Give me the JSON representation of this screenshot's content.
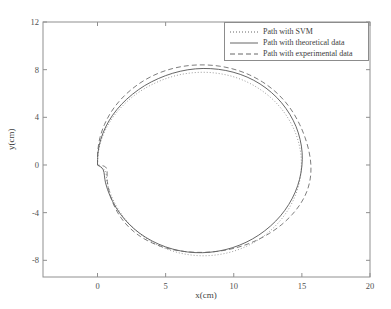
{
  "chart_data": {
    "type": "line",
    "title": "",
    "xlabel": "x(cm)",
    "ylabel": "y(cm)",
    "xlim": [
      -4,
      20
    ],
    "ylim": [
      -9.4,
      12
    ],
    "xticks": [
      0,
      5,
      10,
      15,
      20
    ],
    "xtick_labels": [
      "0",
      "5",
      "10",
      "15",
      "20"
    ],
    "yticks": [
      12,
      8,
      4,
      0,
      -4,
      -8
    ],
    "ytick_labels": [
      "12",
      "8",
      "4",
      "0",
      "-4",
      "-8"
    ],
    "grid": false,
    "legend_position": "upper right",
    "series": [
      {
        "name": "Path with SVM",
        "style": "dotted",
        "color": "#8a8a8a",
        "description": "Closed circular path, nearly coincident with theoretical path, slight deviations in lower-left quadrant",
        "points": [
          [
            0.0,
            0.0
          ],
          [
            0.06,
            1.05
          ],
          [
            0.28,
            2.1
          ],
          [
            0.66,
            3.12
          ],
          [
            1.18,
            4.08
          ],
          [
            1.85,
            4.97
          ],
          [
            2.64,
            5.78
          ],
          [
            3.54,
            6.47
          ],
          [
            4.53,
            7.03
          ],
          [
            5.58,
            7.45
          ],
          [
            6.68,
            7.7
          ],
          [
            7.79,
            7.78
          ],
          [
            8.89,
            7.68
          ],
          [
            9.96,
            7.41
          ],
          [
            10.97,
            6.97
          ],
          [
            11.9,
            6.37
          ],
          [
            12.74,
            5.63
          ],
          [
            13.46,
            4.77
          ],
          [
            14.05,
            3.81
          ],
          [
            14.5,
            2.78
          ],
          [
            14.8,
            1.7
          ],
          [
            14.95,
            0.59
          ],
          [
            14.94,
            -0.53
          ],
          [
            14.78,
            -1.63
          ],
          [
            14.47,
            -2.7
          ],
          [
            14.01,
            -3.72
          ],
          [
            13.41,
            -4.67
          ],
          [
            12.68,
            -5.52
          ],
          [
            11.84,
            -6.25
          ],
          [
            10.9,
            -6.84
          ],
          [
            9.89,
            -7.27
          ],
          [
            8.83,
            -7.53
          ],
          [
            7.74,
            -7.62
          ],
          [
            6.65,
            -7.52
          ],
          [
            5.59,
            -7.25
          ],
          [
            4.58,
            -6.81
          ],
          [
            3.65,
            -6.22
          ],
          [
            2.82,
            -5.49
          ],
          [
            2.1,
            -4.64
          ],
          [
            1.51,
            -3.69
          ],
          [
            1.05,
            -2.67
          ],
          [
            0.73,
            -1.6
          ],
          [
            0.56,
            -0.5
          ],
          [
            0.0,
            0.0
          ]
        ]
      },
      {
        "name": "Path with theoretical data",
        "style": "solid",
        "color": "#555555",
        "description": "Smooth closed circle, center approx (7.5, 0.1), radius approx 7.7 cm",
        "points": [
          [
            0.0,
            0.0
          ],
          [
            0.04,
            1.08
          ],
          [
            0.24,
            2.15
          ],
          [
            0.6,
            3.19
          ],
          [
            1.11,
            4.18
          ],
          [
            1.77,
            5.1
          ],
          [
            2.56,
            5.93
          ],
          [
            3.46,
            6.66
          ],
          [
            4.46,
            7.25
          ],
          [
            5.52,
            7.7
          ],
          [
            6.63,
            7.99
          ],
          [
            7.75,
            8.1
          ],
          [
            8.87,
            8.03
          ],
          [
            9.95,
            7.79
          ],
          [
            10.98,
            7.38
          ],
          [
            11.93,
            6.8
          ],
          [
            12.78,
            6.07
          ],
          [
            13.51,
            5.22
          ],
          [
            14.11,
            4.26
          ],
          [
            14.57,
            3.23
          ],
          [
            14.87,
            2.14
          ],
          [
            15.02,
            1.03
          ],
          [
            15.0,
            -0.09
          ],
          [
            14.83,
            -1.2
          ],
          [
            14.51,
            -2.28
          ],
          [
            14.04,
            -3.31
          ],
          [
            13.43,
            -4.27
          ],
          [
            12.69,
            -5.13
          ],
          [
            11.84,
            -5.88
          ],
          [
            10.9,
            -6.49
          ],
          [
            9.88,
            -6.95
          ],
          [
            8.81,
            -7.24
          ],
          [
            7.71,
            -7.36
          ],
          [
            6.61,
            -7.3
          ],
          [
            5.53,
            -7.06
          ],
          [
            4.5,
            -6.65
          ],
          [
            3.55,
            -6.08
          ],
          [
            2.7,
            -5.37
          ],
          [
            1.97,
            -4.53
          ],
          [
            1.37,
            -3.59
          ],
          [
            0.91,
            -2.57
          ],
          [
            0.59,
            -1.5
          ],
          [
            0.42,
            -0.4
          ],
          [
            0.0,
            0.0
          ]
        ]
      },
      {
        "name": "Path with experimental data",
        "style": "dashed",
        "color": "#666666",
        "description": "Closed path slightly larger than theoretical, bulging outward at top and right, max x approx 15.9, max y approx 8.4",
        "points": [
          [
            0.0,
            0.0
          ],
          [
            0.02,
            1.15
          ],
          [
            0.18,
            2.3
          ],
          [
            0.52,
            3.42
          ],
          [
            1.02,
            4.48
          ],
          [
            1.68,
            5.46
          ],
          [
            2.48,
            6.33
          ],
          [
            3.4,
            7.08
          ],
          [
            4.43,
            7.68
          ],
          [
            5.53,
            8.1
          ],
          [
            6.67,
            8.34
          ],
          [
            7.83,
            8.4
          ],
          [
            8.98,
            8.29
          ],
          [
            10.09,
            8.01
          ],
          [
            11.14,
            7.57
          ],
          [
            12.11,
            6.97
          ],
          [
            12.98,
            6.23
          ],
          [
            13.73,
            5.37
          ],
          [
            14.35,
            4.41
          ],
          [
            14.85,
            3.37
          ],
          [
            15.24,
            2.28
          ],
          [
            15.52,
            1.15
          ],
          [
            15.66,
            0.02
          ],
          [
            15.62,
            -1.1
          ],
          [
            15.38,
            -2.18
          ],
          [
            14.93,
            -3.2
          ],
          [
            14.3,
            -4.14
          ],
          [
            13.53,
            -4.99
          ],
          [
            12.63,
            -5.73
          ],
          [
            11.64,
            -6.34
          ],
          [
            10.58,
            -6.81
          ],
          [
            9.47,
            -7.13
          ],
          [
            8.34,
            -7.3
          ],
          [
            7.21,
            -7.33
          ],
          [
            6.1,
            -7.22
          ],
          [
            5.04,
            -6.97
          ],
          [
            4.05,
            -6.56
          ],
          [
            3.15,
            -6.0
          ],
          [
            2.38,
            -5.3
          ],
          [
            1.75,
            -4.47
          ],
          [
            1.26,
            -3.52
          ],
          [
            0.92,
            -2.48
          ],
          [
            0.72,
            -1.38
          ],
          [
            0.64,
            -0.24
          ],
          [
            0.0,
            0.0
          ]
        ]
      }
    ]
  },
  "axes": {
    "x_label": "x(cm)",
    "y_label": "y(cm)"
  },
  "legend": {
    "entries": [
      {
        "label": "Path with SVM",
        "style": "dotted"
      },
      {
        "label": "Path with theoretical data",
        "style": "solid"
      },
      {
        "label": "Path with experimental data",
        "style": "dashed"
      }
    ]
  }
}
